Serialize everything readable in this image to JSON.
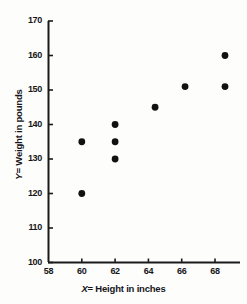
{
  "chart_data": {
    "type": "scatter",
    "title": "",
    "xlabel": "X = Height in inches",
    "ylabel": "Y = Weight in pounds",
    "xlabel_var": "X",
    "xlabel_rest": "= Height in inches",
    "ylabel_var": "Y",
    "ylabel_rest": "= Weight in pounds",
    "xlim": [
      58,
      69.5
    ],
    "ylim": [
      100,
      170
    ],
    "xticks": [
      58,
      60,
      62,
      64,
      66,
      68
    ],
    "yticks": [
      100,
      110,
      120,
      130,
      140,
      150,
      160,
      170
    ],
    "xtick_labels": [
      "58",
      "60",
      "62",
      "64",
      "66",
      "68"
    ],
    "ytick_labels": [
      "100",
      "110",
      "120",
      "130",
      "140",
      "150",
      "160",
      "170"
    ],
    "grid": false,
    "legend": false,
    "marker": "filled-circle",
    "marker_color": "#111111",
    "axis_color": "#1a1a1a",
    "background_color": "#fdfdfc",
    "x": [
      60,
      60,
      62,
      62,
      62,
      64.4,
      66.2,
      68.6,
      68.6,
      68.6
    ],
    "y": [
      135,
      120,
      140,
      135,
      130,
      145,
      151,
      160,
      151,
      151
    ],
    "points": [
      {
        "x": 60,
        "y": 135
      },
      {
        "x": 60,
        "y": 120
      },
      {
        "x": 62,
        "y": 140
      },
      {
        "x": 62,
        "y": 135
      },
      {
        "x": 62,
        "y": 130
      },
      {
        "x": 64.4,
        "y": 145
      },
      {
        "x": 66.2,
        "y": 151
      },
      {
        "x": 68.6,
        "y": 160
      },
      {
        "x": 68.6,
        "y": 151
      }
    ]
  }
}
